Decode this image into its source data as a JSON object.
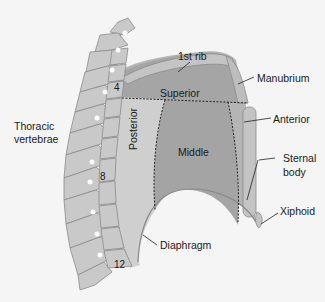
{
  "labels": {
    "first_rib": "1st rib",
    "manubrium": "Manubrium",
    "superior": "Superior",
    "anterior": "Anterior",
    "middle": "Middle",
    "posterior": "Posterior",
    "thoracic_vertebrae_1": "Thoracic",
    "thoracic_vertebrae_2": "vertebrae",
    "sternal_body_1": "Sternal",
    "sternal_body_2": "body",
    "xiphoid": "Xiphoid",
    "diaphragm": "Diaphragm"
  },
  "vertebra_numbers": {
    "v4": "4",
    "v8": "8",
    "v12": "12"
  },
  "colors": {
    "background": "#f5f5f5",
    "bone": "#c9c9c9",
    "bone_outline": "#8a8a8a",
    "superior": "#a9a9a9",
    "middle": "#a6a6a6",
    "posterior": "#d0d0d0",
    "anterior": "#bdbdbd"
  }
}
